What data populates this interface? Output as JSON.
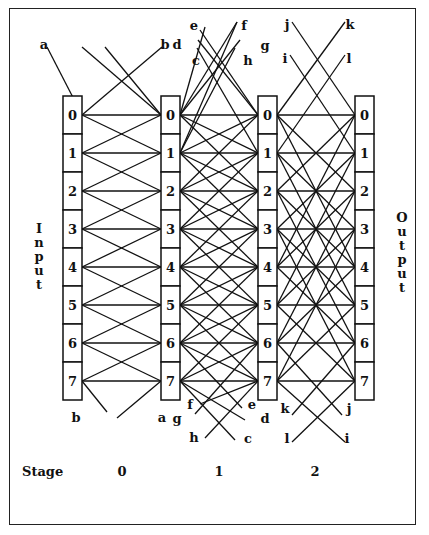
{
  "diagram": {
    "type": "multistage interconnection network (PM2I-style)",
    "nodes": [
      "0",
      "1",
      "2",
      "3",
      "4",
      "5",
      "6",
      "7"
    ],
    "input_label": "Input",
    "output_label": "Output",
    "stage_label": "Stage",
    "stages": [
      {
        "label": "0",
        "offsets": [
          1
        ]
      },
      {
        "label": "1",
        "offsets": [
          1,
          2
        ]
      },
      {
        "label": "2",
        "offsets": [
          2,
          4
        ]
      }
    ],
    "wrap_labels": {
      "stage0": {
        "top": [
          "a",
          "b"
        ],
        "bottom": [
          "b",
          "a"
        ]
      },
      "stage1": {
        "top": [
          "c",
          "d",
          "e",
          "f",
          "g",
          "h"
        ],
        "bottom": [
          "f",
          "g",
          "h",
          "e",
          "d",
          "c"
        ]
      },
      "stage2": {
        "top": [
          "i",
          "j",
          "k",
          "l"
        ],
        "bottom": [
          "k",
          "l",
          "j",
          "i"
        ]
      }
    },
    "colors": {
      "line": "#111111",
      "box_fill": "#ffffff",
      "frame": "#222222"
    }
  }
}
